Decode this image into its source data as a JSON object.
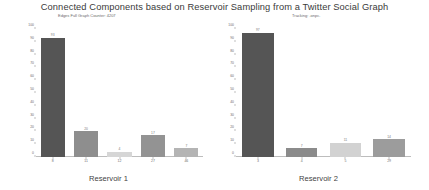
{
  "figure": {
    "title": "Connected Components based on Reservoir Sampling from a Twitter Social Graph",
    "background": "#ffffff"
  },
  "chart_data": [
    {
      "type": "bar",
      "title": "Edges Full Graph Counter: 4207",
      "xlabel": "Reservoir 1",
      "ylabel": "",
      "categories": [
        "8",
        "11",
        "12",
        "27",
        "46"
      ],
      "values": [
        93,
        20,
        4,
        17,
        7
      ],
      "value_labels": [
        "93",
        "20",
        "4",
        "17",
        "7"
      ],
      "bar_colors": [
        "#555555",
        "#8e8e8e",
        "#d6d6d6",
        "#939393",
        "#b4b4b4"
      ],
      "ylim": [
        0,
        100
      ],
      "yticks": [
        "100",
        "90",
        "80",
        "70",
        "60",
        "50",
        "40",
        "30",
        "20",
        "10",
        "0"
      ],
      "grid": false,
      "legend": "none"
    },
    {
      "type": "bar",
      "title": "Tracking: .onpc.",
      "xlabel": "Reservoir 2",
      "ylabel": "",
      "categories": [
        "3",
        "4",
        "5",
        "29"
      ],
      "values": [
        97,
        7,
        11,
        14
      ],
      "value_labels": [
        "97",
        "7",
        "11",
        "14"
      ],
      "bar_colors": [
        "#555555",
        "#8b8b8b",
        "#d2d2d2",
        "#9c9c9c"
      ],
      "ylim": [
        0,
        100
      ],
      "yticks": [
        "100",
        "90",
        "80",
        "70",
        "60",
        "50",
        "40",
        "30",
        "20",
        "10",
        "0"
      ],
      "grid": false,
      "legend": "none"
    }
  ]
}
